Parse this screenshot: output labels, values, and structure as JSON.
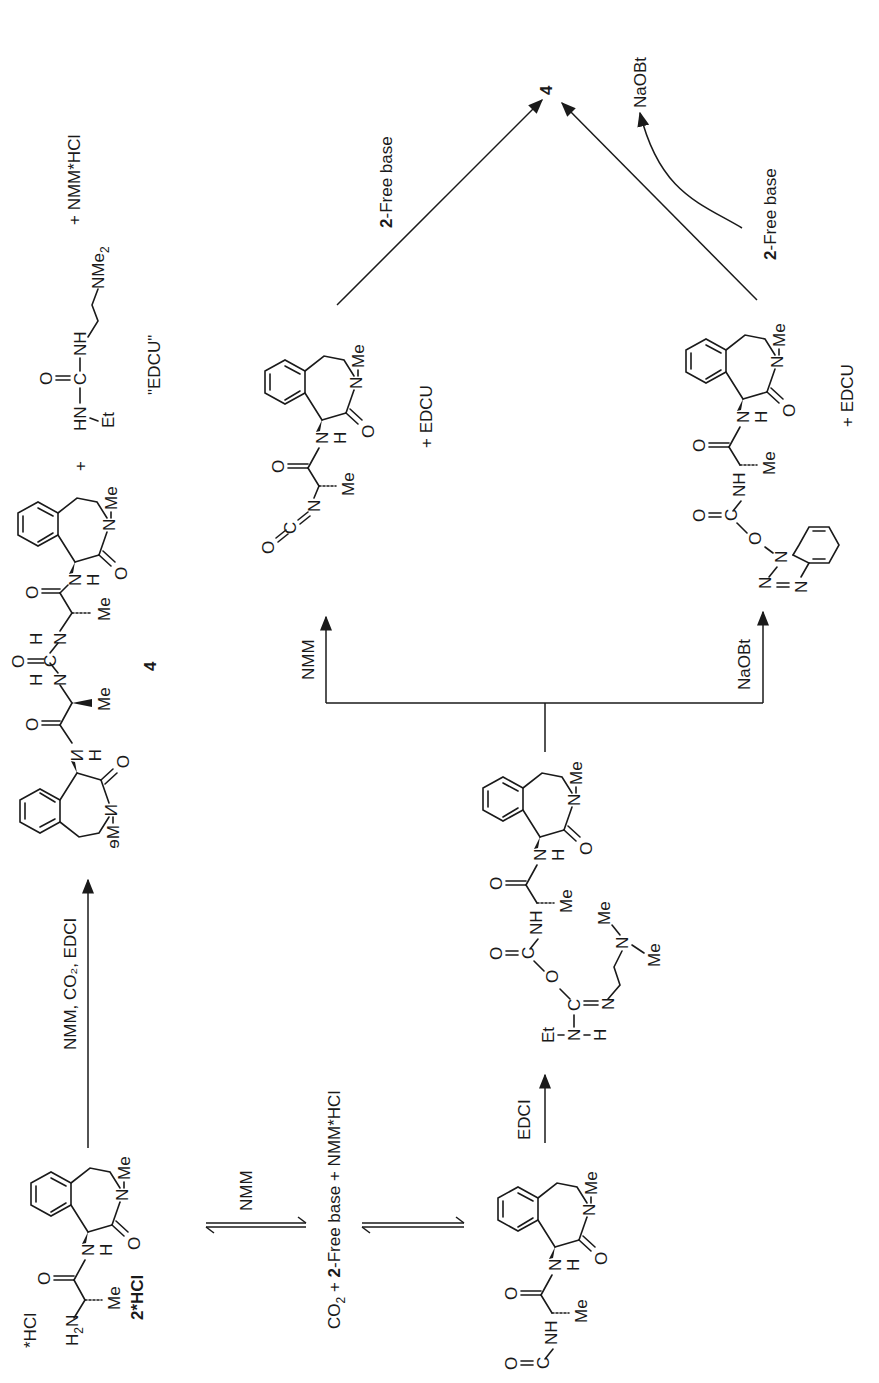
{
  "scheme": {
    "compounds": {
      "start": {
        "label": "2*HCl",
        "salt": "*HCl",
        "amine": "H2N"
      },
      "product": {
        "label": "4"
      },
      "isocyanate_byproduct": "+ EDCU",
      "obt_byproduct": "+ EDCU"
    },
    "byproducts": {
      "edcu_label": "\"EDCU\"",
      "nmm_hcl": "+ NMM*HCl",
      "plus": "+"
    },
    "arrows": {
      "direct": "NMM, CO₂, EDCI",
      "equilibrium1": "NMM",
      "equilibrium_product": "CO₂ + 2-Free base + NMM*HCl",
      "activation": "EDCI",
      "branch_left": "NMM",
      "branch_right": "NaOBt",
      "to_product_left": "2-Free base",
      "to_product_right_in": "2-Free base",
      "to_product_right_out": "NaOBt"
    },
    "atoms": {
      "O": "O",
      "N": "N",
      "H": "H",
      "C": "C",
      "Me": "Me",
      "Et": "Et",
      "NH": "NH",
      "HN": "HN",
      "NMe2": "NMe",
      "two": "2"
    }
  }
}
